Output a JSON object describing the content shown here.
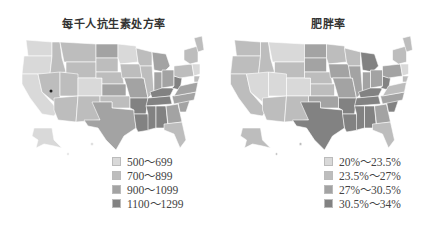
{
  "left_map": {
    "title": "每千人抗生素处方率",
    "legend": [
      {
        "label": "500～699",
        "color": "#d9d9d9"
      },
      {
        "label": "700～899",
        "color": "#bdbdbd"
      },
      {
        "label": "900～1099",
        "color": "#a3a3a3"
      },
      {
        "label": "1100～1299",
        "color": "#828282"
      }
    ]
  },
  "right_map": {
    "title": "肥胖率",
    "legend": [
      {
        "label": "20%～23.5%",
        "color": "#d9d9d9"
      },
      {
        "label": "23.5%～27%",
        "color": "#bdbdbd"
      },
      {
        "label": "27%～30.5%",
        "color": "#a3a3a3"
      },
      {
        "label": "30.5%～34%",
        "color": "#828282"
      }
    ]
  }
}
